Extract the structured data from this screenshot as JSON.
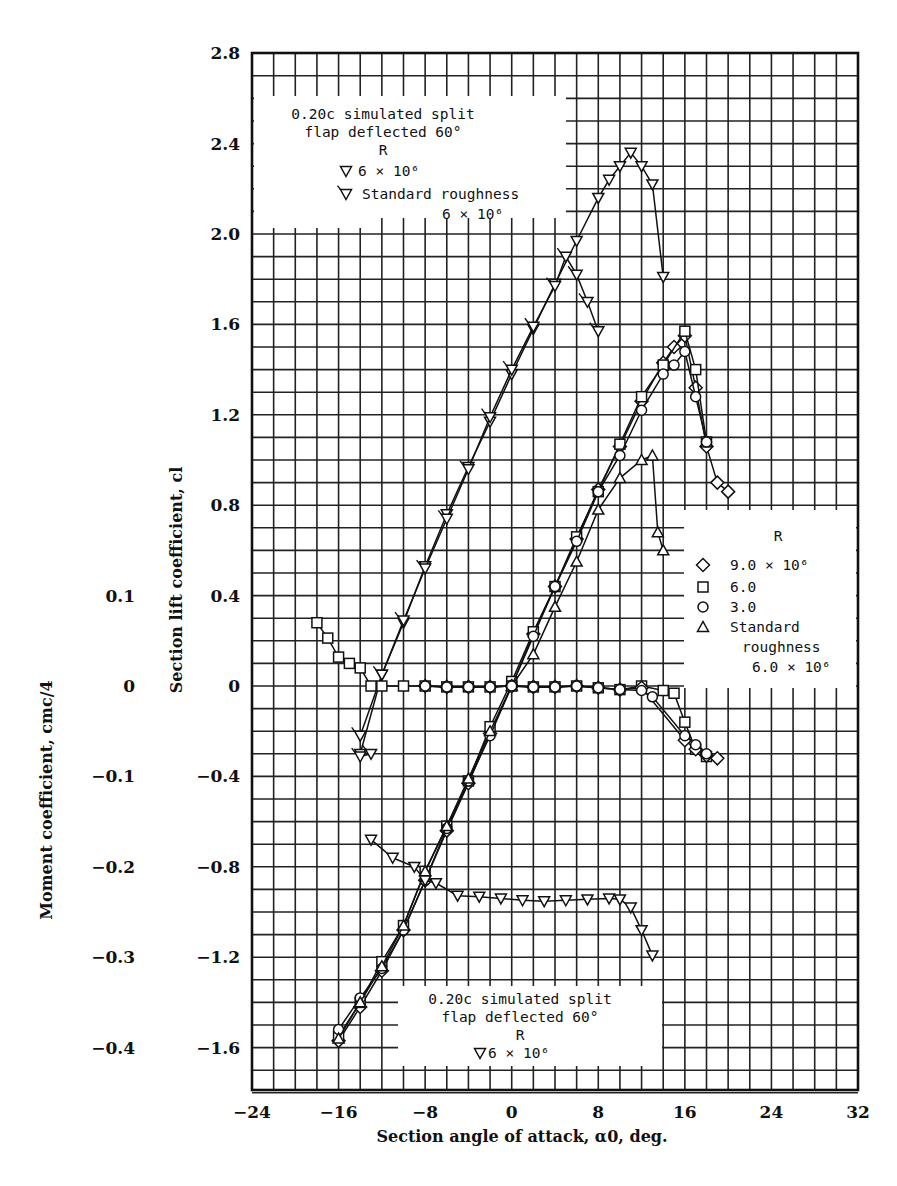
{
  "chart_data": {
    "type": "line",
    "title": "",
    "xlabel": "Section angle of attack, α0, deg.",
    "ylabel": "Section lift coefficient, cl",
    "y2label": "Moment coefficient, cmc/4",
    "xlim": [
      -24,
      32
    ],
    "ylim": [
      -1.8,
      2.8
    ],
    "y2lim": [
      -0.45,
      0.7
    ],
    "grid": true,
    "x_ticks": [
      "-24",
      "-16",
      "-8",
      "0",
      "8",
      "16",
      "24",
      "32"
    ],
    "x_tick_values": [
      -24,
      -16,
      -8,
      0,
      8,
      16,
      24,
      32
    ],
    "y_ticks": [
      "2.8",
      "2.4",
      "2.0",
      "1.6",
      "1.2",
      "0.8",
      "0.4",
      "0",
      "-0.4",
      "-0.8",
      "-1.2",
      "-1.6"
    ],
    "y_tick_values": [
      2.8,
      2.4,
      2.0,
      1.6,
      1.2,
      0.8,
      0.4,
      0,
      -0.4,
      -0.8,
      -1.2,
      -1.6
    ],
    "y2_ticks": [
      "0.1",
      "0",
      "-0.1",
      "-0.2",
      "-0.3",
      "-0.4"
    ],
    "y2_tick_values": [
      0.1,
      0,
      -0.1,
      -0.2,
      -0.3,
      -0.4
    ],
    "legend_top": {
      "title": [
        "0.20c simulated split",
        "flap deflected 60°",
        "R"
      ],
      "entries": [
        {
          "marker": "triangle-down",
          "label": "6 × 10⁶"
        },
        {
          "marker": "triangle-down-flagged",
          "label": "Standard roughness",
          "label2": "6 × 10⁶"
        }
      ]
    },
    "legend_right": {
      "title": "R",
      "entries": [
        {
          "marker": "diamond",
          "label": "9.0 × 10⁶"
        },
        {
          "marker": "square",
          "label": "6.0"
        },
        {
          "marker": "circle",
          "label": "3.0"
        },
        {
          "marker": "triangle-up",
          "label": "Standard",
          "label2": "roughness",
          "label3": "6.0 × 10⁶"
        }
      ]
    },
    "legend_bottom": {
      "title": [
        "0.20c simulated split",
        "flap deflected 60°",
        "R"
      ],
      "entries": [
        {
          "marker": "triangle-down",
          "label": "6 × 10⁶"
        }
      ]
    },
    "series": [
      {
        "name": "Flap 60°, R=6×10⁶ (cl)",
        "axis": "cl",
        "marker": "triangle-down",
        "x": [
          -14,
          -12,
          -10,
          -8,
          -6,
          -4,
          -2,
          0,
          2,
          4,
          6,
          8,
          9,
          10,
          11,
          12,
          13,
          14
        ],
        "y": [
          -0.3,
          0.05,
          0.28,
          0.53,
          0.76,
          0.97,
          1.17,
          1.38,
          1.58,
          1.78,
          1.97,
          2.16,
          2.24,
          2.3,
          2.36,
          2.3,
          2.22,
          1.81
        ]
      },
      {
        "name": "Flap 60°, Standard roughness 6×10⁶ (cl)",
        "axis": "cl",
        "marker": "triangle-down-flagged",
        "x": [
          -14,
          -12,
          -10,
          -8,
          -6,
          -4,
          -2,
          0,
          2,
          4,
          5,
          6,
          7,
          8
        ],
        "y": [
          -0.22,
          0.05,
          0.29,
          0.52,
          0.74,
          0.96,
          1.19,
          1.4,
          1.59,
          1.77,
          1.9,
          1.82,
          1.7,
          1.57
        ]
      },
      {
        "name": "R=9.0×10⁶ (cl)",
        "axis": "cl",
        "marker": "diamond",
        "x": [
          -16,
          -14,
          -12,
          -10,
          -8,
          -6,
          -4,
          -2,
          0,
          2,
          4,
          6,
          8,
          10,
          12,
          14,
          15,
          16,
          17,
          18,
          19,
          20
        ],
        "y": [
          -1.57,
          -1.42,
          -1.26,
          -1.08,
          -0.86,
          -0.64,
          -0.43,
          -0.21,
          0.0,
          0.23,
          0.44,
          0.65,
          0.87,
          1.06,
          1.26,
          1.43,
          1.5,
          1.55,
          1.32,
          1.06,
          0.9,
          0.86
        ]
      },
      {
        "name": "R=6.0×10⁶ (cl)",
        "axis": "cl",
        "marker": "square",
        "x": [
          -16,
          -14,
          -12,
          -10,
          -8,
          -6,
          -4,
          -2,
          0,
          2,
          4,
          6,
          8,
          10,
          12,
          14,
          16,
          17,
          18
        ],
        "y": [
          -1.55,
          -1.4,
          -1.22,
          -1.06,
          -0.82,
          -0.62,
          -0.42,
          -0.18,
          0.02,
          0.24,
          0.44,
          0.66,
          0.86,
          1.07,
          1.28,
          1.42,
          1.57,
          1.4,
          1.08
        ]
      },
      {
        "name": "R=3.0×10⁶ (cl)",
        "axis": "cl",
        "marker": "circle",
        "x": [
          -16,
          -14,
          -12,
          -10,
          -8,
          -6,
          -4,
          -2,
          0,
          2,
          4,
          6,
          8,
          10,
          12,
          14,
          15,
          16,
          17,
          18
        ],
        "y": [
          -1.52,
          -1.38,
          -1.25,
          -1.08,
          -0.86,
          -0.63,
          -0.42,
          -0.22,
          0.0,
          0.22,
          0.44,
          0.64,
          0.86,
          1.02,
          1.22,
          1.38,
          1.42,
          1.48,
          1.28,
          1.08
        ]
      },
      {
        "name": "Standard roughness 6.0×10⁶ (cl)",
        "axis": "cl",
        "marker": "triangle-up",
        "x": [
          -16,
          -14,
          -12,
          -10,
          -8,
          -6,
          -4,
          -2,
          0,
          2,
          4,
          6,
          8,
          10,
          12,
          13,
          13.5,
          14
        ],
        "y": [
          -1.56,
          -1.4,
          -1.24,
          -1.06,
          -0.82,
          -0.62,
          -0.41,
          -0.2,
          0.0,
          0.14,
          0.35,
          0.55,
          0.78,
          0.92,
          1.0,
          1.02,
          0.68,
          0.6
        ]
      },
      {
        "name": "R=6.0×10⁶ (cm)",
        "axis": "cm",
        "marker": "square",
        "x": [
          -18,
          -17,
          -16,
          -15,
          -14,
          -13,
          -12,
          -10,
          -8,
          -6,
          -4,
          -2,
          0,
          2,
          4,
          6,
          8,
          10,
          12,
          14,
          15,
          16,
          17,
          18
        ],
        "y": [
          0.07,
          0.053,
          0.032,
          0.025,
          0.02,
          0.0,
          0.0,
          0.0,
          0.0,
          -0.001,
          -0.001,
          -0.001,
          0.0,
          -0.001,
          -0.001,
          0.0,
          -0.002,
          -0.004,
          0.0,
          -0.005,
          -0.008,
          -0.04,
          -0.07,
          -0.078
        ]
      },
      {
        "name": "R=9.0×10⁶ (cm)",
        "axis": "cm",
        "marker": "diamond",
        "x": [
          -8,
          -6,
          -4,
          -2,
          0,
          2,
          4,
          6,
          8,
          10,
          12,
          16,
          17,
          18,
          19
        ],
        "y": [
          0.0,
          -0.001,
          -0.001,
          -0.001,
          0.0,
          -0.001,
          -0.001,
          0.0,
          -0.002,
          -0.004,
          -0.002,
          -0.06,
          -0.07,
          -0.077,
          -0.08
        ]
      },
      {
        "name": "R=3.0×10⁶ (cm)",
        "axis": "cm",
        "marker": "circle",
        "x": [
          -8,
          -6,
          -4,
          -2,
          0,
          2,
          4,
          6,
          8,
          10,
          12,
          13,
          16,
          17,
          18
        ],
        "y": [
          0.0,
          -0.001,
          -0.001,
          -0.001,
          0.0,
          -0.001,
          -0.001,
          0.0,
          -0.002,
          -0.004,
          -0.005,
          -0.012,
          -0.055,
          -0.065,
          -0.075
        ]
      },
      {
        "name": "Flap 60°, R=6×10⁶ (cm)",
        "axis": "cm",
        "marker": "triangle-down",
        "x": [
          -13,
          -11,
          -9,
          -8,
          -7,
          -5,
          -3,
          -1,
          1,
          3,
          5,
          7,
          9,
          10,
          11,
          12,
          13
        ],
        "y": [
          -0.17,
          -0.19,
          -0.2,
          -0.215,
          -0.218,
          -0.232,
          -0.233,
          -0.235,
          -0.237,
          -0.238,
          -0.237,
          -0.236,
          -0.235,
          -0.236,
          -0.245,
          -0.27,
          -0.298
        ]
      },
      {
        "name": "Flap 60°, Standard roughness (cm)",
        "axis": "cm",
        "marker": "triangle-down-flagged",
        "x": [
          -14,
          -13
        ],
        "y": [
          -0.078,
          -0.075
        ]
      }
    ]
  }
}
